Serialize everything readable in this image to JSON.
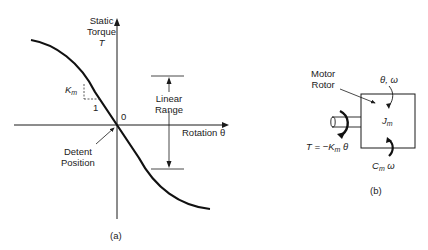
{
  "figure_a": {
    "caption": "(a)",
    "y_axis_label_line1": "Static",
    "y_axis_label_line2": "Torque",
    "y_axis_symbol": "T",
    "x_axis_label": "Rotation θ",
    "origin_label": "0",
    "slope_label": "K",
    "slope_label_sub": "m",
    "slope_run": "1",
    "detent_label_line1": "Detent",
    "detent_label_line2": "Position",
    "linear_range_line1": "Linear",
    "linear_range_line2": "Range"
  },
  "figure_b": {
    "caption": "(b)",
    "rotor_label_line1": "Motor",
    "rotor_label_line2": "Rotor",
    "state_label": "θ, ω",
    "inertia_symbol": "J",
    "inertia_sub": "m",
    "torque_eq_prefix": "T = −K",
    "torque_eq_sub": "m",
    "torque_eq_suffix": " θ",
    "damping_symbol": "C",
    "damping_sub": "m",
    "damping_suffix": " ω"
  }
}
